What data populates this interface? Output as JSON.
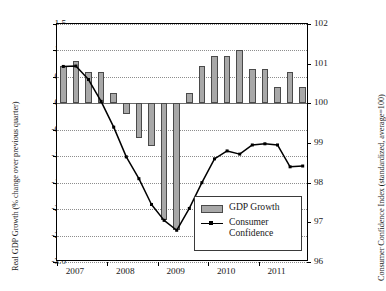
{
  "chart_data": {
    "type": "bar",
    "title": "",
    "xlabel": "",
    "ylabel": "Real GDP Growth (% change over previous quarter)",
    "y2label": "Consumer Confidence Index (standardized, average=100)",
    "grid": true,
    "legend_position": "inside lower-right",
    "ylim": [
      -3.0,
      1.5
    ],
    "y2lim": [
      96,
      102
    ],
    "yticks": [
      "1.5",
      "1.0",
      "0.5",
      "0.0",
      "-0.5",
      "-1.0",
      "-1.5",
      "-2.0",
      "-2.5",
      "-3.0"
    ],
    "ytick_values": [
      1.5,
      1.0,
      0.5,
      0.0,
      -0.5,
      -1.0,
      -1.5,
      -2.0,
      -2.5,
      -3.0
    ],
    "y2ticks": [
      "102",
      "101",
      "100",
      "99",
      "98",
      "97",
      "96"
    ],
    "y2tick_values": [
      102,
      101,
      100,
      99,
      98,
      97,
      96
    ],
    "xticks": [
      "2007",
      "2008",
      "2009",
      "2010",
      "2011"
    ],
    "xtick_values": [
      2007,
      2008,
      2009,
      2010,
      2011
    ],
    "x": [
      "2007Q1",
      "2007Q2",
      "2007Q3",
      "2007Q4",
      "2008Q1",
      "2008Q2",
      "2008Q3",
      "2008Q4",
      "2009Q1",
      "2009Q2",
      "2009Q3",
      "2009Q4",
      "2010Q1",
      "2010Q2",
      "2010Q3",
      "2010Q4",
      "2011Q1",
      "2011Q2",
      "2011Q3",
      "2011Q4"
    ],
    "series": [
      {
        "name": "GDP Growth",
        "type": "bar",
        "axis": "left",
        "color": "#a8a8a8",
        "edge_color": "#4a4a4a",
        "values": [
          0.7,
          0.8,
          0.6,
          0.6,
          0.2,
          -0.2,
          -0.65,
          -0.8,
          -2.2,
          -2.4,
          0.2,
          0.7,
          0.9,
          0.9,
          1.0,
          0.65,
          0.65,
          0.3,
          0.6,
          0.3
        ]
      },
      {
        "name": "Consumer Confidence",
        "type": "line",
        "axis": "right",
        "color": "#000000",
        "marker": "square",
        "values": [
          100.93,
          100.94,
          100.6,
          100.05,
          99.4,
          98.65,
          98.1,
          97.45,
          97.05,
          96.8,
          97.35,
          98.0,
          98.6,
          98.8,
          98.72,
          98.95,
          98.98,
          98.95,
          98.4,
          98.42
        ]
      }
    ],
    "legend": [
      {
        "label": "GDP Growth",
        "marker": "bar-swatch"
      },
      {
        "label": "Consumer Confidence",
        "marker": "line-with-square-marker"
      }
    ]
  },
  "legend": {
    "gdp_label": "GDP Growth",
    "cc_label_line1": "Consumer",
    "cc_label_line2": "Confidence"
  }
}
